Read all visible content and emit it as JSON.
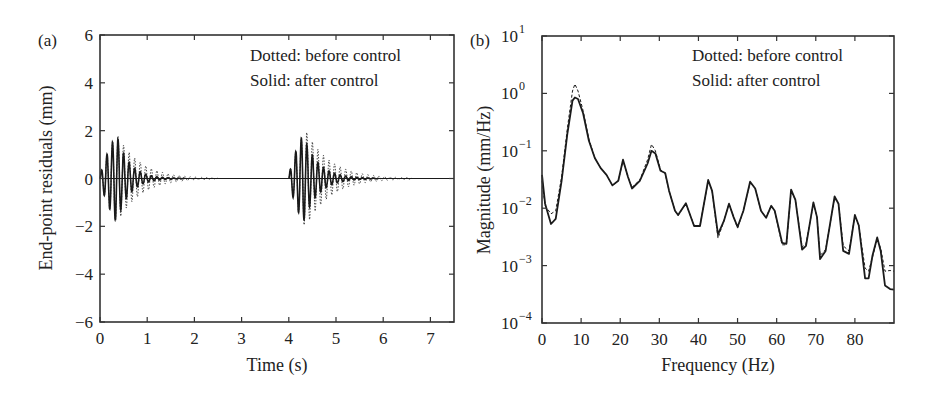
{
  "chart_data": [
    {
      "panel_label": "(a)",
      "type": "line",
      "title": "",
      "xlabel": "Time (s)",
      "ylabel": "End-point residuals (mm)",
      "xlim": [
        0,
        7.5
      ],
      "ylim": [
        -6,
        6
      ],
      "xticks": [
        0,
        1,
        2,
        3,
        4,
        5,
        6,
        7
      ],
      "yticks": [
        -6,
        -4,
        -2,
        0,
        2,
        4,
        6
      ],
      "ytick_labels": [
        "−6",
        "−4",
        "−2",
        "0",
        "2",
        "4",
        "6"
      ],
      "grid": false,
      "legend": [
        "Dotted: before control",
        "Solid: after control"
      ],
      "legend_position": "upper right",
      "series": [
        {
          "name": "before control",
          "style": "dotted",
          "bursts": [
            {
              "start": 0.0,
              "peak_time": 0.35,
              "peak_amplitude": 1.9,
              "decay_end": 1.9,
              "freq_hz": 8.5
            },
            {
              "start": 4.0,
              "peak_time": 4.35,
              "peak_amplitude": 2.05,
              "decay_end": 6.0,
              "freq_hz": 8.5
            }
          ]
        },
        {
          "name": "after control",
          "style": "solid",
          "bursts": [
            {
              "start": 0.0,
              "peak_time": 0.35,
              "peak_amplitude": 1.85,
              "decay_end": 1.2,
              "freq_hz": 8.5
            },
            {
              "start": 4.0,
              "peak_time": 4.3,
              "peak_amplitude": 1.85,
              "decay_end": 5.3,
              "freq_hz": 8.5
            }
          ]
        }
      ]
    },
    {
      "panel_label": "(b)",
      "type": "line",
      "title": "",
      "xlabel": "Frequency (Hz)",
      "ylabel": "Magnitude (mm/Hz)",
      "xlim": [
        0,
        90
      ],
      "ylim": [
        0.0001,
        10
      ],
      "yscale": "log",
      "xticks": [
        0,
        10,
        20,
        30,
        40,
        50,
        60,
        70,
        80
      ],
      "yticks": [
        -4,
        -3,
        -2,
        -1,
        0,
        1
      ],
      "ytick_labels": [
        "10",
        "10",
        "10",
        "10",
        "10",
        "10"
      ],
      "ytick_exponents": [
        "−4",
        "−3",
        "−2",
        "−1",
        "0",
        "1"
      ],
      "grid": false,
      "legend": [
        "Dotted: before control",
        "Solid: after control"
      ],
      "legend_position": "upper right",
      "series": [
        {
          "name": "after control",
          "style": "solid",
          "x": [
            0,
            0.8,
            2.3,
            3.5,
            5,
            6.5,
            7.8,
            8.4,
            9.2,
            10.5,
            12,
            13.5,
            15,
            16.5,
            18,
            19.5,
            20.7,
            22,
            23,
            25,
            27,
            28,
            29,
            30.3,
            31.5,
            32.5,
            34,
            34.8,
            36.8,
            38.9,
            40.4,
            42.5,
            43.5,
            45,
            46.5,
            47.8,
            49,
            50,
            51.5,
            53.2,
            54.5,
            56,
            57.3,
            58.6,
            59.5,
            61.4,
            62.5,
            63.7,
            64.8,
            66.5,
            67.5,
            69.4,
            70.3,
            71.1,
            72.5,
            74.8,
            75.8,
            77,
            78.5,
            80,
            81,
            82.6,
            83.5,
            84.5,
            85.7,
            86.6,
            87.7,
            89,
            90
          ],
          "y": [
            0.038,
            0.012,
            0.0053,
            0.0065,
            0.03,
            0.2,
            0.75,
            0.85,
            0.8,
            0.45,
            0.15,
            0.075,
            0.05,
            0.038,
            0.025,
            0.03,
            0.07,
            0.035,
            0.022,
            0.03,
            0.06,
            0.1,
            0.09,
            0.045,
            0.041,
            0.02,
            0.009,
            0.0076,
            0.0122,
            0.0049,
            0.0049,
            0.031,
            0.02,
            0.0035,
            0.006,
            0.012,
            0.007,
            0.0047,
            0.009,
            0.029,
            0.022,
            0.009,
            0.0068,
            0.011,
            0.009,
            0.0025,
            0.0024,
            0.021,
            0.014,
            0.0019,
            0.0022,
            0.0126,
            0.007,
            0.0013,
            0.0018,
            0.016,
            0.012,
            0.0018,
            0.0016,
            0.0076,
            0.005,
            0.0006,
            0.0006,
            0.0015,
            0.0031,
            0.0018,
            0.00045,
            0.00039,
            0.00038
          ]
        },
        {
          "name": "before control",
          "style": "dotted",
          "x": [
            0,
            0.8,
            2.3,
            3.5,
            5,
            6.5,
            7.8,
            8.4,
            9.2,
            10.5,
            12,
            13.5,
            15,
            16.5,
            18,
            19.5,
            20.7,
            22,
            23,
            25,
            27,
            28,
            29,
            30.3,
            31.5,
            32.5,
            34,
            34.8,
            36.8,
            38.9,
            40.4,
            42.5,
            43.5,
            45,
            46.5,
            47.8,
            49,
            50,
            51.5,
            53.2,
            54.5,
            56,
            57.3,
            58.6,
            59.5,
            61.4,
            62.5,
            63.7,
            64.8,
            66.5,
            67.5,
            69.4,
            70.3,
            71.1,
            72.5,
            74.8,
            75.8,
            77,
            78.5,
            80,
            81,
            82.6,
            83.5,
            84.5,
            85.7,
            86.6,
            87.7,
            89,
            90
          ],
          "y": [
            0.03,
            0.011,
            0.008,
            0.009,
            0.035,
            0.25,
            1.1,
            1.45,
            1.1,
            0.5,
            0.16,
            0.075,
            0.05,
            0.038,
            0.025,
            0.03,
            0.068,
            0.035,
            0.023,
            0.031,
            0.07,
            0.13,
            0.1,
            0.047,
            0.04,
            0.02,
            0.009,
            0.0075,
            0.012,
            0.005,
            0.005,
            0.03,
            0.02,
            0.003,
            0.006,
            0.012,
            0.007,
            0.0045,
            0.009,
            0.028,
            0.022,
            0.009,
            0.007,
            0.011,
            0.009,
            0.0023,
            0.0023,
            0.02,
            0.014,
            0.0021,
            0.0024,
            0.012,
            0.007,
            0.0015,
            0.0019,
            0.015,
            0.012,
            0.0022,
            0.0018,
            0.0074,
            0.005,
            0.0009,
            0.0008,
            0.0014,
            0.0029,
            0.002,
            0.0008,
            0.00082,
            0.0008
          ]
        }
      ]
    }
  ],
  "layout": {
    "panels": [
      {
        "plot_box": {
          "x": 100,
          "y": 35,
          "w": 354,
          "h": 287
        }
      },
      {
        "plot_box": {
          "x": 542,
          "y": 36,
          "w": 352,
          "h": 287
        }
      }
    ],
    "line_color": "#1a1a1a",
    "axis_color": "#333333"
  }
}
